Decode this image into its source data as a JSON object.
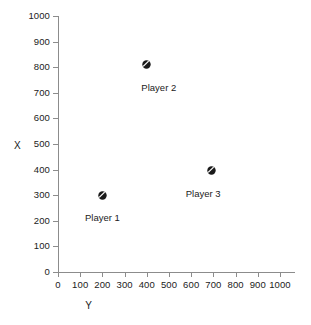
{
  "chart_data": {
    "type": "scatter",
    "title": "",
    "xlabel": "Y",
    "ylabel": "X",
    "xlim": [
      0,
      1000
    ],
    "ylim": [
      0,
      1000
    ],
    "xticks": [
      0,
      100,
      200,
      300,
      400,
      500,
      600,
      700,
      800,
      900,
      1000
    ],
    "yticks": [
      0,
      100,
      200,
      300,
      400,
      500,
      600,
      700,
      800,
      900,
      1000
    ],
    "xtick_labels": [
      "0",
      "100",
      "200",
      "300",
      "400",
      "500",
      "600",
      "700",
      "800",
      "900",
      "1000"
    ],
    "ytick_labels": [
      "0",
      "100",
      "200",
      "300",
      "400",
      "500",
      "600",
      "700",
      "800",
      "900",
      "1000"
    ],
    "grid": false,
    "legend": "none",
    "marker_style": "filled-circle-with-diagonal-slash",
    "marker_color": "#1a1a1a",
    "axis_color": "#8c8c8c",
    "background": "#ffffff",
    "points": [
      {
        "label": "Player 1",
        "x": 200,
        "y": 300,
        "label_dx": 0,
        "label_dy": 18
      },
      {
        "label": "Player 2",
        "x": 400,
        "y": 810,
        "label_dx": 12,
        "label_dy": 18
      },
      {
        "label": "Player 3",
        "x": 690,
        "y": 395,
        "label_dx": -8,
        "label_dy": 18
      }
    ]
  }
}
